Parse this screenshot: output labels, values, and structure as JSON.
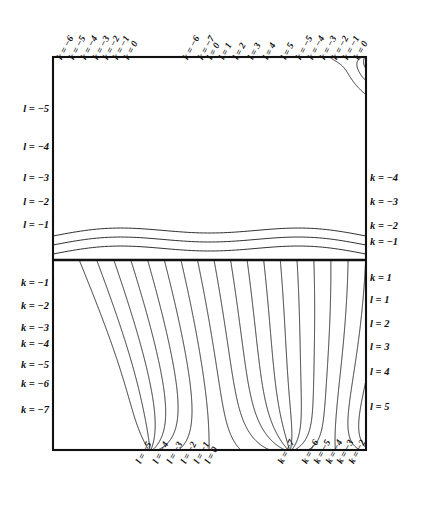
{
  "figure": {
    "type": "conformal-grid-diagram",
    "frame": {
      "left": 53,
      "top": 57,
      "right": 366,
      "bottom": 450,
      "divider_y": 260
    }
  },
  "labels": {
    "top_left_group": [
      {
        "text": "k = -6",
        "x": 64,
        "y": 52
      },
      {
        "text": "k = -5",
        "x": 76,
        "y": 52
      },
      {
        "text": "k = -4",
        "x": 88,
        "y": 52
      },
      {
        "text": "k = -3",
        "x": 100,
        "y": 52
      },
      {
        "text": "k = -2",
        "x": 110,
        "y": 52
      },
      {
        "text": "k = -1",
        "x": 120,
        "y": 52
      },
      {
        "text": "k = 0",
        "x": 131,
        "y": 52
      }
    ],
    "top_middle_group": [
      {
        "text": "k = -6",
        "x": 190,
        "y": 52
      },
      {
        "text": "k = -7",
        "x": 205,
        "y": 52
      },
      {
        "text": "l = 0",
        "x": 214,
        "y": 52
      },
      {
        "text": "l = 1",
        "x": 226,
        "y": 52
      },
      {
        "text": "l = 2",
        "x": 240,
        "y": 52
      },
      {
        "text": "l = 3",
        "x": 255,
        "y": 52
      },
      {
        "text": "l = 4",
        "x": 270,
        "y": 52
      }
    ],
    "top_right_group": [
      {
        "text": "l = 5",
        "x": 288,
        "y": 52
      },
      {
        "text": "k = -5",
        "x": 303,
        "y": 52
      },
      {
        "text": "k = -4",
        "x": 315,
        "y": 52
      },
      {
        "text": "k = -3",
        "x": 327,
        "y": 52
      },
      {
        "text": "k = -2",
        "x": 339,
        "y": 52
      },
      {
        "text": "k = -1",
        "x": 350,
        "y": 52
      },
      {
        "text": "k = 0",
        "x": 361,
        "y": 52
      }
    ],
    "left_upper": [
      {
        "text": "l = -5",
        "y": 110
      },
      {
        "text": "l = -4",
        "y": 148
      },
      {
        "text": "l = -3",
        "y": 179
      },
      {
        "text": "l = -2",
        "y": 203
      },
      {
        "text": "l = -1",
        "y": 226
      }
    ],
    "left_lower": [
      {
        "text": "k = -1",
        "y": 284
      },
      {
        "text": "k = -2",
        "y": 307
      },
      {
        "text": "k = -3",
        "y": 329
      },
      {
        "text": "k = -4",
        "y": 345
      },
      {
        "text": "k = -5",
        "y": 366
      },
      {
        "text": "k = -6",
        "y": 385
      },
      {
        "text": "k = -7",
        "y": 411
      }
    ],
    "right_upper": [
      {
        "text": "k = -4",
        "y": 179
      },
      {
        "text": "k = -3",
        "y": 203
      },
      {
        "text": "k = -2",
        "y": 227
      },
      {
        "text": "k = -1",
        "y": 243
      }
    ],
    "right_lower": [
      {
        "text": "k = 1",
        "y": 279
      },
      {
        "text": "l = 1",
        "y": 301
      },
      {
        "text": "l = 2",
        "y": 325
      },
      {
        "text": "l = 3",
        "y": 348
      },
      {
        "text": "l = 4",
        "y": 373
      },
      {
        "text": "l = 5",
        "y": 408
      }
    ],
    "bottom_left_group": [
      {
        "text": "l = -5",
        "x": 143,
        "y": 456
      },
      {
        "text": "l = -4",
        "x": 160,
        "y": 456
      },
      {
        "text": "l = -3",
        "x": 174,
        "y": 456
      },
      {
        "text": "l = -2",
        "x": 188,
        "y": 456
      },
      {
        "text": "l = -1",
        "x": 201,
        "y": 456
      },
      {
        "text": "l = 0",
        "x": 212,
        "y": 456
      }
    ],
    "bottom_right_group": [
      {
        "text": "k = -7",
        "x": 285,
        "y": 456
      },
      {
        "text": "k = -6",
        "x": 309,
        "y": 456
      },
      {
        "text": "k = -5",
        "x": 321,
        "y": 456
      },
      {
        "text": "k = -4",
        "x": 333,
        "y": 456
      },
      {
        "text": "k = -3",
        "x": 344,
        "y": 456
      },
      {
        "text": "k = -2",
        "x": 356,
        "y": 456
      }
    ]
  },
  "colors": {
    "stroke": "#1a1a1a",
    "frame": "#111111",
    "background": "#ffffff"
  }
}
